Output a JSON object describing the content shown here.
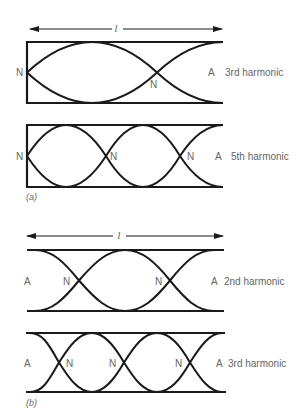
{
  "figure": {
    "length_symbol": "l",
    "panel_a": {
      "caption": "(a)",
      "diagrams": [
        {
          "name": "closed-tube-3rd",
          "left_label": "N",
          "node_labels": [
            "N"
          ],
          "end_label": "A",
          "harmonic_label": "3rd harmonic"
        },
        {
          "name": "closed-tube-5th",
          "left_label": "N",
          "node_labels": [
            "N",
            "N"
          ],
          "end_label": "A",
          "harmonic_label": "5th harmonic"
        }
      ]
    },
    "panel_b": {
      "caption": "(b)",
      "diagrams": [
        {
          "name": "open-tube-2nd",
          "left_label": "A",
          "node_labels": [
            "N",
            "N"
          ],
          "end_label": "A",
          "harmonic_label": "2nd harmonic"
        },
        {
          "name": "open-tube-3rd",
          "left_label": "A",
          "node_labels": [
            "N",
            "N",
            "N"
          ],
          "end_label": "A",
          "harmonic_label": "3rd harmonic"
        }
      ]
    }
  },
  "colors": {
    "line": "#1a1a1a",
    "label": "#666666",
    "background": "#ffffff"
  }
}
